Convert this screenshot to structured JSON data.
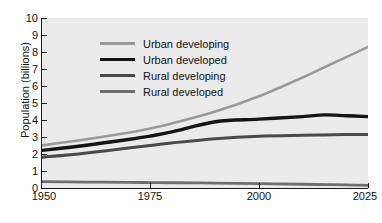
{
  "chart_data": {
    "type": "line",
    "title": "",
    "xlabel": "",
    "ylabel": "Population (billions)",
    "xlim": [
      1950,
      2025
    ],
    "ylim": [
      0,
      10
    ],
    "grid": false,
    "legend_position": "upper-left-inside",
    "xticks": [
      "1950",
      "1975",
      "2000",
      "2025"
    ],
    "xtick_values": [
      1950,
      1975,
      2000,
      2025
    ],
    "yticks": [
      "0",
      "1",
      "2",
      "3",
      "4",
      "5",
      "6",
      "7",
      "8",
      "9",
      "10"
    ],
    "ytick_values": [
      0,
      1,
      2,
      3,
      4,
      5,
      6,
      7,
      8,
      9,
      10
    ],
    "x": [
      1950,
      1960,
      1970,
      1975,
      1980,
      1990,
      2000,
      2010,
      2015,
      2020,
      2025
    ],
    "series": [
      {
        "name": "Urban developing",
        "color": "#9a9a9a",
        "width": 2.6,
        "values": [
          2.5,
          2.85,
          3.25,
          3.5,
          3.8,
          4.5,
          5.4,
          6.5,
          7.1,
          7.7,
          8.3
        ]
      },
      {
        "name": "Urban developed",
        "color": "#141414",
        "width": 3.4,
        "values": [
          2.2,
          2.5,
          2.85,
          3.05,
          3.3,
          3.9,
          4.05,
          4.2,
          4.3,
          4.25,
          4.2
        ]
      },
      {
        "name": "Rural developing",
        "color": "#4a4a4a",
        "width": 3.0,
        "values": [
          1.8,
          2.05,
          2.35,
          2.5,
          2.65,
          2.9,
          3.05,
          3.1,
          3.12,
          3.14,
          3.15
        ]
      },
      {
        "name": "Rural developed",
        "color": "#6e6e6e",
        "width": 2.8,
        "values": [
          0.37,
          0.35,
          0.33,
          0.32,
          0.31,
          0.29,
          0.26,
          0.22,
          0.2,
          0.18,
          0.15
        ]
      }
    ]
  },
  "colors": {
    "plot_background": "#ebebeb",
    "page_background": "#ffffff",
    "axis": "#1a1a1a",
    "text": "#111111"
  }
}
